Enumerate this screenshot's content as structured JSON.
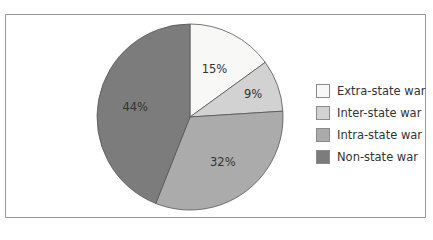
{
  "chart_data": {
    "type": "pie",
    "title": "",
    "categories": [
      "Extra-state war",
      "Inter-state war",
      "Intra-state war",
      "Non-state war"
    ],
    "values": [
      15,
      9,
      32,
      44
    ],
    "labels": [
      "15%",
      "9%",
      "32%",
      "44%"
    ],
    "colors": [
      "#f8f8f6",
      "#d2d2d2",
      "#ababab",
      "#7c7c7c"
    ],
    "legend_position": "right",
    "start_angle": "12 o'clock, clockwise"
  },
  "legend": {
    "items": [
      {
        "label": "Extra-state war",
        "color": "#f8f8f6"
      },
      {
        "label": "Inter-state war",
        "color": "#d2d2d2"
      },
      {
        "label": "Intra-state war",
        "color": "#ababab"
      },
      {
        "label": "Non-state war",
        "color": "#7c7c7c"
      }
    ]
  }
}
